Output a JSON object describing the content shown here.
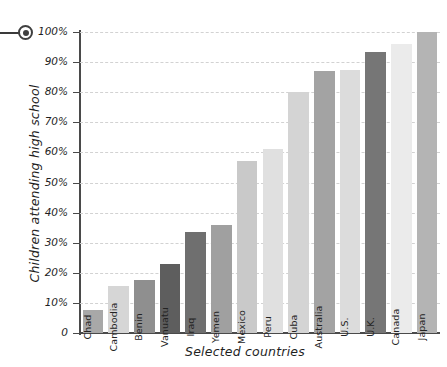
{
  "marker": {
    "name": "bullseye-marker",
    "leader_line": true
  },
  "chart_data": {
    "type": "bar",
    "title": "",
    "xlabel": "Selected countries",
    "ylabel": "Children attending high school",
    "ylim": [
      0,
      100
    ],
    "grid": true,
    "legend": "none",
    "y_tick_labels": [
      "100%",
      "90%",
      "80%",
      "70%",
      "60%",
      "50%",
      "40%",
      "30%",
      "20%",
      "10%",
      "0"
    ],
    "y_ticks": [
      100,
      90,
      80,
      70,
      60,
      50,
      40,
      30,
      20,
      10,
      0
    ],
    "categories": [
      "Chad",
      "Cambodia",
      "Benin",
      "Vanuatu",
      "Iraq",
      "Yemen",
      "Mexico",
      "Peru",
      "Cuba",
      "Australia",
      "U.S.",
      "U.K.",
      "Canada",
      "Japan"
    ],
    "values": [
      7.5,
      15.5,
      17.5,
      23,
      33.5,
      36,
      57,
      61,
      80,
      87,
      87.5,
      93.5,
      96,
      100
    ],
    "bar_colors": [
      "#a8a8a8",
      "#d6d6d6",
      "#8f8f8f",
      "#5e5e5e",
      "#6f6f6f",
      "#a0a0a0",
      "#c9c9c9",
      "#e0e0e0",
      "#d4d4d4",
      "#a3a3a3",
      "#dcdcdc",
      "#767676",
      "#ebebeb",
      "#b4b4b4"
    ]
  },
  "style": {
    "axis_color": "#4a4a4a",
    "grid_color": "#d2d2d2",
    "text_color": "#1f1f1f",
    "background": "#ffffff"
  }
}
